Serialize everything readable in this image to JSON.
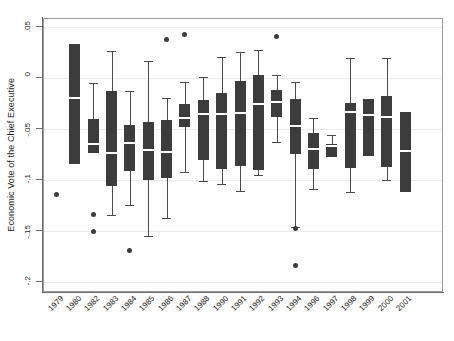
{
  "chart": {
    "type": "box",
    "title": "",
    "xlabel": "",
    "ylabel": "Economic Vote of the Chief Executive"
  },
  "axes": {
    "y_ticks": [
      {
        "label": ".05",
        "value": 0.05
      },
      {
        "label": "0",
        "value": 0.0
      },
      {
        "label": "-.05",
        "value": -0.05
      },
      {
        "label": "-.1",
        "value": -0.1
      },
      {
        "label": "-.15",
        "value": -0.15
      },
      {
        "label": "-.2",
        "value": -0.2
      }
    ],
    "ylim": [
      -0.21,
      0.062
    ],
    "grid": true,
    "legend": "none"
  },
  "chart_data": {
    "type": "box",
    "title": "",
    "xlabel": "",
    "ylabel": "Economic Vote of the Chief Executive",
    "ylim": [
      -0.21,
      0.062
    ],
    "yticks": [
      0.05,
      0,
      -0.05,
      -0.1,
      -0.15,
      -0.2
    ],
    "ytick_labels": [
      ".05",
      "0",
      "-.05",
      "-.1",
      "-.15",
      "-.2"
    ],
    "grid": true,
    "categories": [
      "1979",
      "1980",
      "1982",
      "1983",
      "1984",
      "1985",
      "1986",
      "1987",
      "1988",
      "1990",
      "1991",
      "1992",
      "1993",
      "1994",
      "1996",
      "1997",
      "1998",
      "1999",
      "2000",
      "2001"
    ],
    "boxes": [
      {
        "category": "1979",
        "q1": null,
        "median": null,
        "q3": null,
        "whisker_low": null,
        "whisker_high": null,
        "outliers": [
          -0.1146
        ]
      },
      {
        "category": "1980",
        "q1": -0.0843,
        "median": -0.0196,
        "q3": 0.0333,
        "whisker_low": -0.0843,
        "whisker_high": 0.0333,
        "outliers": []
      },
      {
        "category": "1982",
        "q1": -0.0735,
        "median": -0.0647,
        "q3": -0.0402,
        "whisker_low": -0.0735,
        "whisker_high": -0.0049,
        "outliers": [
          -0.1343,
          -0.15
        ]
      },
      {
        "category": "1983",
        "q1": -0.1059,
        "median": -0.0735,
        "q3": -0.0127,
        "whisker_low": -0.1343,
        "whisker_high": 0.0265,
        "outliers": []
      },
      {
        "category": "1984",
        "q1": -0.0912,
        "median": -0.0637,
        "q3": -0.0461,
        "whisker_low": -0.1245,
        "whisker_high": -0.0127,
        "outliers": [
          -0.1696
        ]
      },
      {
        "category": "1985",
        "q1": -0.1,
        "median": -0.0706,
        "q3": -0.0431,
        "whisker_low": -0.1549,
        "whisker_high": 0.0167,
        "outliers": []
      },
      {
        "category": "1986",
        "q1": -0.098,
        "median": -0.0725,
        "q3": -0.0412,
        "whisker_low": -0.1373,
        "whisker_high": -0.0196,
        "outliers": [
          0.0382
        ]
      },
      {
        "category": "1987",
        "q1": -0.048,
        "median": -0.0392,
        "q3": -0.0255,
        "whisker_low": -0.0922,
        "whisker_high": -0.0039,
        "outliers": [
          0.0431
        ]
      },
      {
        "category": "1988",
        "q1": -0.0804,
        "median": -0.0353,
        "q3": -0.0216,
        "whisker_low": -0.101,
        "whisker_high": 0.001,
        "outliers": []
      },
      {
        "category": "1990",
        "q1": -0.0892,
        "median": -0.0353,
        "q3": -0.0147,
        "whisker_low": -0.1039,
        "whisker_high": 0.0206,
        "outliers": []
      },
      {
        "category": "1991",
        "q1": -0.0863,
        "median": -0.0343,
        "q3": -0.0029,
        "whisker_low": -0.1108,
        "whisker_high": 0.0255,
        "outliers": []
      },
      {
        "category": "1992",
        "q1": -0.0902,
        "median": -0.0255,
        "q3": 0.0029,
        "whisker_low": -0.0951,
        "whisker_high": 0.0275,
        "outliers": []
      },
      {
        "category": "1993",
        "q1": -0.0382,
        "median": -0.0235,
        "q3": -0.0118,
        "whisker_low": -0.0627,
        "whisker_high": 0.0029,
        "outliers": [
          0.0402
        ]
      },
      {
        "category": "1994",
        "q1": -0.0745,
        "median": -0.0471,
        "q3": -0.0206,
        "whisker_low": -0.1461,
        "whisker_high": -0.0039,
        "outliers": [
          -0.148,
          -0.1843
        ]
      },
      {
        "category": "1996",
        "q1": -0.0892,
        "median": -0.0696,
        "q3": -0.0539,
        "whisker_low": -0.1088,
        "whisker_high": -0.0392,
        "outliers": []
      },
      {
        "category": "1997",
        "q1": -0.0775,
        "median": -0.0667,
        "q3": -0.0647,
        "whisker_low": -0.0775,
        "whisker_high": -0.0559,
        "outliers": []
      },
      {
        "category": "1998",
        "q1": -0.0882,
        "median": -0.0333,
        "q3": -0.0245,
        "whisker_low": -0.1118,
        "whisker_high": 0.0196,
        "outliers": []
      },
      {
        "category": "1999",
        "q1": -0.0765,
        "median": -0.0363,
        "q3": -0.0206,
        "whisker_low": -0.0765,
        "whisker_high": -0.0206,
        "outliers": []
      },
      {
        "category": "2000",
        "q1": -0.0873,
        "median": -0.0382,
        "q3": -0.0176,
        "whisker_low": -0.1,
        "whisker_high": 0.0196,
        "outliers": []
      },
      {
        "category": "2001",
        "q1": -0.1118,
        "median": -0.0716,
        "q3": -0.0333,
        "whisker_low": -0.1118,
        "whisker_high": -0.0333,
        "outliers": []
      }
    ]
  },
  "colors": {
    "box_fill": "#3c3c3c",
    "median": "#ffffff",
    "whisker": "#4a4a4a",
    "grid": "#e9e9e9",
    "axis": "#6e6e6e",
    "background": "#ffffff"
  }
}
